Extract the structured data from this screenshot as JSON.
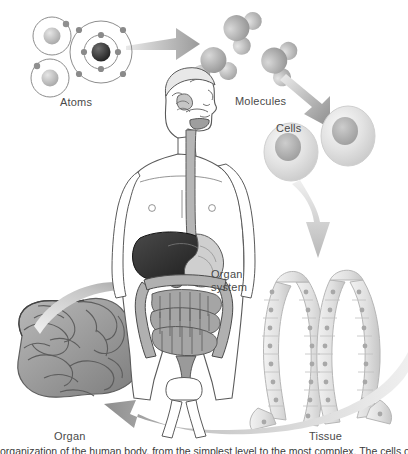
{
  "figure": {
    "caption_partial": "organization of the human body, from the simplest level to the most complex. The cells of"
  },
  "palette": {
    "arrow_dark": "#8f8f8f",
    "arrow_mid": "#b4b4b4",
    "arrow_light": "#d8d8d8",
    "arrow_faint": "#e8e8e8",
    "outline": "#5a5a5a",
    "label_text": "#4a4a4a",
    "cell_body": "#dcdcdc",
    "cell_nucleus": "#b0b0b0",
    "organ_fill": "#9a9a9a",
    "organ_shade": "#6e6e6e",
    "liver_dark": "#2e2e2e",
    "tissue_fill": "#e3e3e3",
    "tissue_nucleus": "#a8a8a8",
    "skin": "#ffffff",
    "background": "#ffffff"
  },
  "labels": {
    "atoms": "Atoms",
    "molecules": "Molecules",
    "cells": "Cells",
    "organ_system": "Organ\nsystem",
    "organ": "Organ",
    "tissue": "Tissue"
  },
  "molecules": [
    {
      "formula": "H2O",
      "display": "H₂O",
      "rotation": -62,
      "x": 240,
      "y": 30
    },
    {
      "formula": "H2O",
      "display": "H₂O",
      "rotation": -8,
      "x": 214,
      "y": 64
    },
    {
      "formula": "H2O",
      "display": "H₂O",
      "rotation": -70,
      "x": 278,
      "y": 62
    }
  ],
  "atoms": [
    {
      "type": "small",
      "shells": 1,
      "electrons": 1,
      "x": 52,
      "y": 36
    },
    {
      "type": "small",
      "shells": 1,
      "electrons": 1,
      "x": 50,
      "y": 76
    },
    {
      "type": "large",
      "shells": 2,
      "electrons": 8,
      "x": 100,
      "y": 52
    }
  ],
  "cells": [
    {
      "x": 290,
      "y": 150,
      "rx": 26,
      "ry": 28
    },
    {
      "x": 348,
      "y": 135,
      "rx": 26,
      "ry": 29
    }
  ],
  "arrows": [
    {
      "name": "atoms-to-molecules",
      "from": "atoms",
      "to": "molecules",
      "direction": "right",
      "style": "tapered"
    },
    {
      "name": "molecules-to-cells",
      "from": "molecules",
      "to": "cells",
      "direction": "down-right",
      "style": "tapered"
    },
    {
      "name": "cells-to-tissue",
      "from": "cells",
      "to": "tissue",
      "direction": "down",
      "style": "tapered"
    },
    {
      "name": "tissue-to-organ",
      "from": "tissue",
      "to": "organ",
      "direction": "curve-left",
      "style": "curved-band"
    },
    {
      "name": "organ-to-organ-system",
      "from": "organ",
      "to": "organ-system",
      "direction": "curve-up-right",
      "style": "curved-band"
    }
  ],
  "body_figure": {
    "name": "human-figure-digestive-system",
    "parts": [
      "head-profile",
      "mouth",
      "esophagus",
      "liver",
      "stomach",
      "small-intestine",
      "large-intestine",
      "rectum"
    ]
  },
  "tissue": {
    "name": "columnar-epithelium",
    "columns": 2,
    "description": "Two folded sheets of columnar epithelial cells, each cell with a nucleus"
  },
  "organ": {
    "name": "intestines",
    "description": "Coiled small and large intestine mass"
  }
}
